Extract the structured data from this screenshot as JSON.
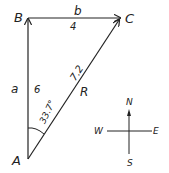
{
  "diagram": {
    "points": {
      "A": {
        "label": "A"
      },
      "B": {
        "label": "B"
      },
      "C": {
        "label": "C"
      }
    },
    "vectors": {
      "a": {
        "label": "a",
        "magnitude": "6"
      },
      "b": {
        "label": "b",
        "magnitude": "4"
      },
      "R": {
        "label": "R",
        "magnitude": "7.2"
      }
    },
    "angle": {
      "value": "33.7°"
    },
    "compass": {
      "north": "N",
      "south": "S",
      "east": "E",
      "west": "W"
    }
  }
}
